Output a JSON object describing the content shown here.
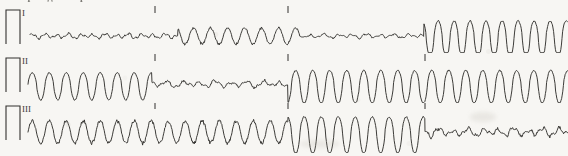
{
  "document": {
    "type": "ecg-rhythm-strip",
    "clipped_caption_text": "из переходит в трепетани",
    "background_color": "#f7f6f3",
    "trace_color": "#33312e",
    "label_color": "#3b3a38",
    "width": 568,
    "height": 156
  },
  "strips": [
    {
      "id": "lead-1",
      "lead_label": "I",
      "top": 2,
      "baseline": 36,
      "calibration": {
        "x": 6,
        "width": 14,
        "height": 26
      },
      "ticks": [
        155,
        288
      ],
      "segments": [
        {
          "name": "fine-fibrillation",
          "start": 30,
          "end": 178
        },
        {
          "name": "coarse-fibrillation",
          "start": 178,
          "end": 300
        },
        {
          "name": "low-amplitude-undulation",
          "start": 300,
          "end": 424
        },
        {
          "name": "ventricular-flutter",
          "start": 424,
          "end": 568
        }
      ]
    },
    {
      "id": "lead-2",
      "lead_label": "II",
      "top": 52,
      "baseline": 84,
      "calibration": {
        "x": 6,
        "width": 14,
        "height": 26
      },
      "ticks": [
        155,
        288,
        425
      ],
      "segments": [
        {
          "name": "coarse-fibrillation",
          "start": 28,
          "end": 152
        },
        {
          "name": "low-amplitude-undulation",
          "start": 152,
          "end": 288
        },
        {
          "name": "ventricular-flutter",
          "start": 288,
          "end": 568
        }
      ]
    },
    {
      "id": "lead-3",
      "lead_label": "III",
      "top": 102,
      "baseline": 132,
      "calibration": {
        "x": 6,
        "width": 14,
        "height": 26
      },
      "ticks": [
        155,
        288,
        425
      ],
      "segments": [
        {
          "name": "coarse-fibrillation",
          "start": 28,
          "end": 288
        },
        {
          "name": "ventricular-flutter",
          "start": 288,
          "end": 425
        },
        {
          "name": "fine-fibrillation",
          "start": 425,
          "end": 568
        }
      ]
    }
  ],
  "chart_data": {
    "type": "line",
    "title": "",
    "xlabel": "",
    "ylabel": "",
    "grid": false,
    "legend": "none",
    "series": [
      {
        "name": "I",
        "waveform_model": [
          {
            "from": 30,
            "to": 178,
            "shape": "irregular-fine",
            "amplitude": 3.0,
            "period": 12
          },
          {
            "from": 178,
            "to": 300,
            "shape": "sine-rounded",
            "amplitude": 8.0,
            "period": 17
          },
          {
            "from": 300,
            "to": 424,
            "shape": "irregular-fine",
            "amplitude": 2.5,
            "period": 14
          },
          {
            "from": 424,
            "to": 568,
            "shape": "flutter",
            "amplitude": 19.0,
            "period": 16
          }
        ]
      },
      {
        "name": "II",
        "waveform_model": [
          {
            "from": 28,
            "to": 152,
            "shape": "flutter",
            "amplitude": 14.0,
            "period": 17
          },
          {
            "from": 152,
            "to": 288,
            "shape": "irregular-fine",
            "amplitude": 4.0,
            "period": 16
          },
          {
            "from": 288,
            "to": 568,
            "shape": "flutter",
            "amplitude": 17.0,
            "period": 17
          }
        ]
      },
      {
        "name": "III",
        "waveform_model": [
          {
            "from": 28,
            "to": 288,
            "shape": "sine-rounded",
            "amplitude": 11.0,
            "period": 17
          },
          {
            "from": 288,
            "to": 425,
            "shape": "flutter",
            "amplitude": 19.0,
            "period": 17
          },
          {
            "from": 425,
            "to": 568,
            "shape": "irregular-fine",
            "amplitude": 5.0,
            "period": 15
          }
        ]
      }
    ]
  }
}
